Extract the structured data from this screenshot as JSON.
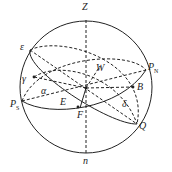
{
  "diagram": {
    "colors": {
      "stroke": "#222222",
      "background": "#ffffff"
    },
    "labels": {
      "zenith": "Z",
      "nadir": "n",
      "ecliptic_pole": "ε",
      "north_pole": "P",
      "north_pole_sub": "N",
      "south_pole": "P",
      "south_pole_sub": "S",
      "west": "W",
      "east": "E",
      "point_f": "F",
      "point_b": "B",
      "point_q": "Q",
      "vernal_equinox": "γ",
      "right_ascension": "α",
      "declination": "δ"
    }
  }
}
